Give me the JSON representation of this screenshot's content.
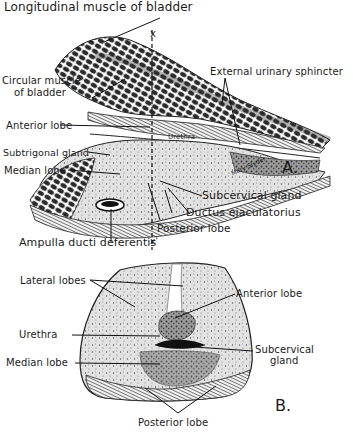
{
  "figure_a": {
    "panel_label": "A.",
    "labels": {
      "longitudinal_muscle": "Longitudinal muscle of bladder",
      "circular_muscle_line1": "Circular muscle",
      "circular_muscle_line2": "of bladder",
      "external_sphincter": "External urinary sphincter",
      "anterior_lobe": "Anterior lobe",
      "urethra": "Urethra",
      "subtrigonal_gland": "Subtrigonal gland",
      "median_lobe": "Median lobe",
      "subcervical_gland": "Subcervical gland",
      "ductus_ejaculatorius": "Ductus ejaculatorius",
      "posterior_lobe": "Posterior lobe",
      "ampulla": "Ampulla ducti deferentis",
      "section_mark_top": "x",
      "section_mark_bottom": "x'",
      "signature": "Mary Slyder"
    }
  },
  "figure_b": {
    "panel_label": "B.",
    "labels": {
      "lateral_lobes": "Lateral lobes",
      "anterior_lobe": "Anterior lobe",
      "urethra": "Urethra",
      "median_lobe": "Median lobe",
      "subcervical_line1": "Subcervical",
      "subcervical_line2": "gland",
      "posterior_lobe": "Posterior lobe"
    }
  },
  "colors": {
    "ink": "#1b1b1b",
    "tissue_dark": "#2a2a2a",
    "tissue_mid": "#8a8a8a",
    "tissue_light": "#d6d6d6",
    "paper": "#ffffff"
  }
}
